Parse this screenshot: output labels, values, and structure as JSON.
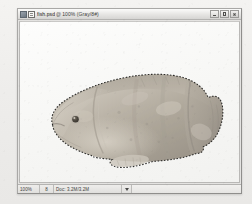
{
  "window": {
    "title": "fish.psd",
    "separator": "@",
    "zoom_label": "100% (Gray/8#)",
    "app_icon": "application-icon",
    "doc_icon": "document-icon",
    "minimize_label": "Minimize",
    "maximize_label": "Maximize",
    "close_label": "Close"
  },
  "canvas": {
    "document_name": "fish.psd",
    "image_alt": "photograph of an oscar cichlid fish facing left with an active selection marquee"
  },
  "status_bar": {
    "zoom": "100%",
    "size": "8",
    "doc_info": "Doc: 3.2M/3.2M",
    "expand_icon": "triangle-up-icon"
  }
}
